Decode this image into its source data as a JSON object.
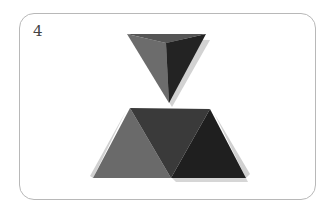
{
  "figure": {
    "label": "4",
    "colors": {
      "background": "#ffffff",
      "border": "#b8b8b8",
      "face_light": "#6a6a6a",
      "face_mid": "#4a4a4a",
      "face_dark": "#262626",
      "face_top": "#555555",
      "shadow": "#d0d0d0"
    }
  }
}
